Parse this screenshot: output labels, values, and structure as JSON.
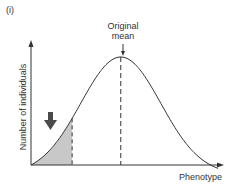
{
  "panel_label": "(i)",
  "annotation": {
    "line1": "Original",
    "line2": "mean"
  },
  "axes": {
    "ylabel": "Number of individuals",
    "xlabel": "Phenotype"
  },
  "selection_arrow": {
    "direction": "down",
    "meaning": "selection against low-phenotype individuals"
  },
  "chart_data": {
    "type": "area",
    "title": "",
    "xlabel": "Phenotype",
    "ylabel": "Number of individuals",
    "curve": "normal distribution",
    "mean_position_fraction": 0.48,
    "shaded_region": {
      "from_fraction": 0.0,
      "to_fraction": 0.22,
      "color": "#c8c8c8"
    },
    "annotations": [
      "Original mean"
    ],
    "grid": false,
    "legend": "none"
  },
  "colors": {
    "curve": "#333333",
    "shade": "#c8c8c8",
    "arrow": "#4a4a4a"
  }
}
